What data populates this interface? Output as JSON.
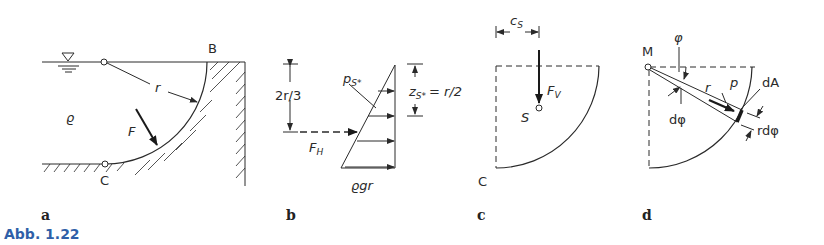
{
  "figure": {
    "caption": "Abb. 1.22",
    "caption_color": "#2f5fa8",
    "panels": {
      "a": {
        "letter": "a",
        "labels": {
          "B": "B",
          "C": "C",
          "r": "r",
          "rho": "ϱ",
          "F": "F"
        },
        "icons": [
          "water-level-symbol",
          "hatched-wall"
        ]
      },
      "b": {
        "letter": "b",
        "labels": {
          "two_r_3": "2r/3",
          "p": "p",
          "p_sub": "S*",
          "z": "z",
          "z_sub": "S*",
          "z_eq": "= r/2",
          "F": "F",
          "F_sub": "H",
          "rho_g_r": "ϱgr"
        }
      },
      "c": {
        "letter": "c",
        "labels": {
          "c": "c",
          "c_sub": "S",
          "F": "F",
          "F_sub": "V",
          "S": "S",
          "C": "C"
        }
      },
      "d": {
        "letter": "d",
        "labels": {
          "M": "M",
          "phi": "φ",
          "dphi": "dφ",
          "r": "r",
          "p": "p",
          "dA": "dA",
          "rdphi": "rdφ"
        }
      }
    }
  }
}
